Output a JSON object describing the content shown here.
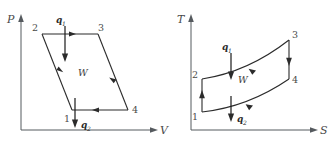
{
  "figure": {
    "background_color": "#ffffff",
    "line_color": "#2b2b2b",
    "axis_color": "#555a5e",
    "text_color": "#3a3a3a"
  },
  "diagrams": [
    {
      "id": "pv-diagram",
      "name": "pressure-volume-diagram",
      "axes": {
        "y_label": "P",
        "x_label": "V"
      },
      "cycle_shape": "parallelogram",
      "state_points": [
        {
          "label": "2",
          "position": "top-left"
        },
        {
          "label": "3",
          "position": "top-right"
        },
        {
          "label": "4",
          "position": "bottom-right"
        },
        {
          "label": "1",
          "position": "bottom-left"
        }
      ],
      "heat_in": {
        "label": "q",
        "subscript": "1",
        "direction": "down",
        "position": "top"
      },
      "heat_out": {
        "label": "q",
        "subscript": "2",
        "direction": "down",
        "position": "bottom"
      },
      "work_label": "W",
      "process_arrows": [
        {
          "from": "2",
          "to": "3",
          "direction": "right"
        },
        {
          "from": "3",
          "to": "4",
          "direction": "down-right"
        },
        {
          "from": "4",
          "to": "1",
          "direction": "left"
        },
        {
          "from": "1",
          "to": "2",
          "direction": "up-left"
        }
      ]
    },
    {
      "id": "ts-diagram",
      "name": "temperature-entropy-diagram",
      "axes": {
        "y_label": "T",
        "x_label": "S"
      },
      "cycle_shape": "curved-quadrilateral",
      "state_points": [
        {
          "label": "2",
          "position": "left-upper"
        },
        {
          "label": "3",
          "position": "top-right"
        },
        {
          "label": "4",
          "position": "right-lower"
        },
        {
          "label": "1",
          "position": "bottom-left"
        }
      ],
      "heat_in": {
        "label": "q",
        "subscript": "1",
        "direction": "down",
        "position": "top"
      },
      "heat_out": {
        "label": "q",
        "subscript": "2",
        "direction": "down",
        "position": "bottom"
      },
      "work_label": "W",
      "process_arrows": [
        {
          "from": "2",
          "to": "3",
          "direction": "right"
        },
        {
          "from": "3",
          "to": "4",
          "direction": "down"
        },
        {
          "from": "1",
          "to": "4",
          "direction": "right"
        },
        {
          "from": "1",
          "to": "2",
          "direction": "up"
        }
      ]
    }
  ]
}
